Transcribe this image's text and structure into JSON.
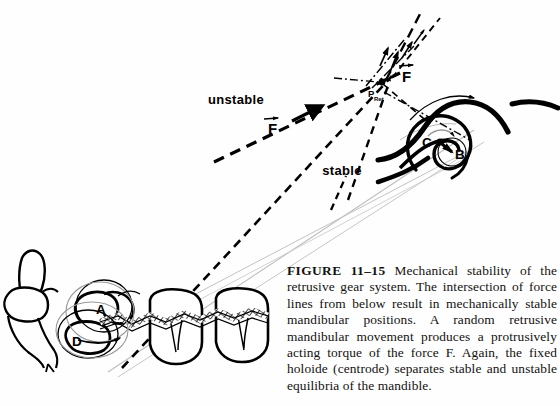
{
  "figure": {
    "number": "FIGURE 11–15",
    "caption": "Mechanical stability of the retrusive gear system. The intersection of force lines from below result in mechanically stable mandibular positions. A random retrusive mandibular movement produces a protrusively acting torque of the force F. Again, the fixed holoide (centrode) separates stable and unstable equilibria of the mandible."
  },
  "diagram": {
    "title_alt": "Mechanical stability of the retrusive gear system",
    "labels": {
      "unstable": "unstable",
      "stable": "stable",
      "force_upper": "F",
      "force_lower": "F",
      "pivot_point": "P",
      "pivot_subscript": "Ret",
      "condyle_center": "C",
      "condyle_inner": "B",
      "tooth_upper": "A",
      "tooth_lower": "D"
    },
    "colors": {
      "ink": "#000000",
      "background": "#fefefe",
      "guide_gray": "#b8b8b8",
      "hatch": "#111111"
    },
    "elements": {
      "dashed_force_line": "unstable force line F, dashed, directed up-right with arrowhead",
      "dash_dot_lines": "dash-dot force lines converging at P_Ret with arrowheads",
      "stable_line": "dashed stable equilibrium line descending from P_Ret",
      "guide_lines": "thin gray sight lines from dentition to condyle",
      "centrode_spiral": "fixed holoide (centrode) spiral about points C and B",
      "rotation_arrows": "curved arrows indicating condylar and articular eminence rotation",
      "dentition": "mandibular incisors, premolar and molars with crosshatched occlusal interface",
      "tooth_circles": "overlapping gear circles at premolar marked A and D"
    }
  }
}
